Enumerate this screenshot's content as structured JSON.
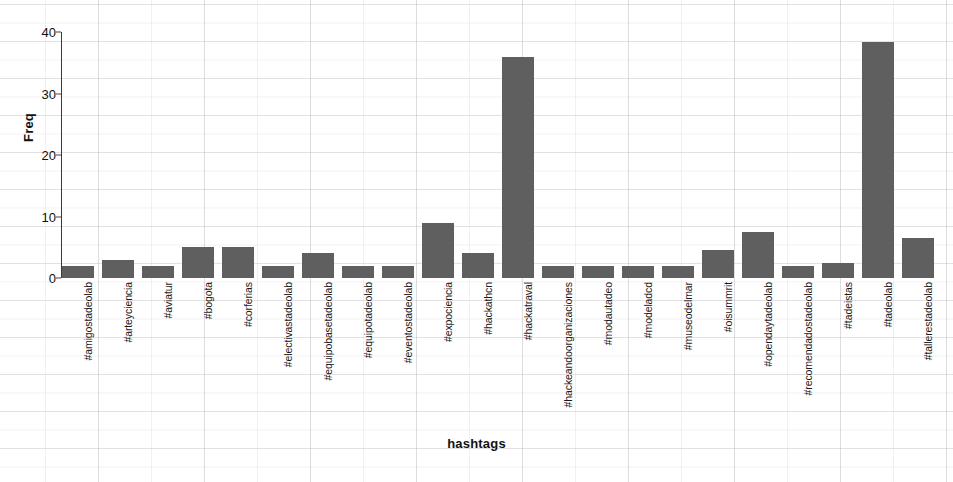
{
  "chart_data": {
    "type": "bar",
    "title": "",
    "subtitle": "",
    "xlabel": "hashtags",
    "ylabel": "Freq",
    "ylim": [
      0,
      42
    ],
    "yticks": [
      0,
      10,
      20,
      30,
      40
    ],
    "ytick_labels": [
      "0",
      "10",
      "20",
      "30",
      "40"
    ],
    "grid": true,
    "legend": null,
    "bar_color": "#5f5f5f",
    "categories": [
      "#amigostadeolab",
      "#arteyciencia",
      "#aviatur",
      "#bogota",
      "#corferias",
      "#electivastadeolab",
      "#equipobasetadeolab",
      "#equipotadeolab",
      "#eventostadeolab",
      "#expociencia",
      "#hackathcn",
      "#hackatraval",
      "#hackeandoorganizaciones",
      "#modautadeo",
      "#modeladcd",
      "#museodelmar",
      "#oisummrit",
      "#opendaytadeolab",
      "#recomendadostadeolab",
      "#tadeistas",
      "#tadeolab",
      "#tallerestadeolab"
    ],
    "values": [
      2,
      3,
      2,
      5,
      5,
      2,
      4,
      2,
      2,
      9,
      4,
      36,
      2,
      2,
      2,
      2,
      4.5,
      7.5,
      2,
      2.5,
      38.5,
      6.5
    ]
  }
}
